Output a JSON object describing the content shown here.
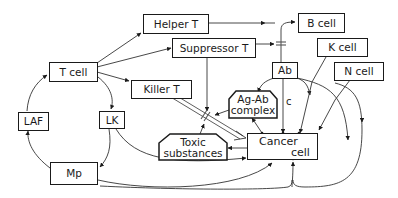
{
  "diagram": {
    "nodes": {
      "helper_t": {
        "label": "Helper T"
      },
      "suppressor_t": {
        "label": "Suppressor T"
      },
      "b_cell": {
        "label": "B cell"
      },
      "t_cell": {
        "label": "T cell"
      },
      "killer_t": {
        "label": "Killer T"
      },
      "k_cell": {
        "label": "K cell"
      },
      "ab": {
        "label": "Ab"
      },
      "n_cell": {
        "label": "N cell"
      },
      "ag_ab_complex": {
        "line1": "Ag-Ab",
        "line2": "complex"
      },
      "laf": {
        "label": "LAF"
      },
      "lk": {
        "label": "LK"
      },
      "toxic_substances": {
        "line1": "Toxic",
        "line2": "substances"
      },
      "cancer_cell": {
        "line1": "Cancer",
        "line2": "cell"
      },
      "mp": {
        "label": "Mp"
      }
    },
    "edge_labels": {
      "ab_to_cancer": "c"
    },
    "edges": [
      {
        "from": "T cell",
        "to": "Helper T"
      },
      {
        "from": "T cell",
        "to": "Suppressor T"
      },
      {
        "from": "T cell",
        "to": "Killer T"
      },
      {
        "from": "T cell",
        "to": "LK"
      },
      {
        "from": "Helper T",
        "to": "B cell",
        "type": "stimulate"
      },
      {
        "from": "Suppressor T",
        "to": "B cell",
        "type": "inhibit"
      },
      {
        "from": "B cell",
        "to": "Ab"
      },
      {
        "from": "Ab",
        "to": "Cancer cell",
        "label": "c"
      },
      {
        "from": "Ab",
        "to": "Ag-Ab complex"
      },
      {
        "from": "Ab",
        "to": "Cancer cell (via K cell)"
      },
      {
        "from": "K cell",
        "to": "Cancer cell"
      },
      {
        "from": "N cell",
        "to": "Cancer cell"
      },
      {
        "from": "Killer T",
        "to": "Cancer cell",
        "type": "double"
      },
      {
        "from": "Ag-Ab complex",
        "to": "Killer T pathway",
        "type": "inhibit"
      },
      {
        "from": "Toxic substances",
        "to": "Killer T pathway",
        "type": "inhibit"
      },
      {
        "from": "Cancer cell",
        "to": "Ag-Ab complex"
      },
      {
        "from": "Cancer cell",
        "to": "Toxic substances"
      },
      {
        "from": "LK",
        "to": "Cancer cell"
      },
      {
        "from": "LK",
        "to": "Mp"
      },
      {
        "from": "Mp",
        "to": "LAF"
      },
      {
        "from": "LAF",
        "to": "T cell"
      },
      {
        "from": "Mp",
        "to": "Cancer cell"
      },
      {
        "from": "Cancer cell",
        "to": "Mp"
      }
    ]
  }
}
